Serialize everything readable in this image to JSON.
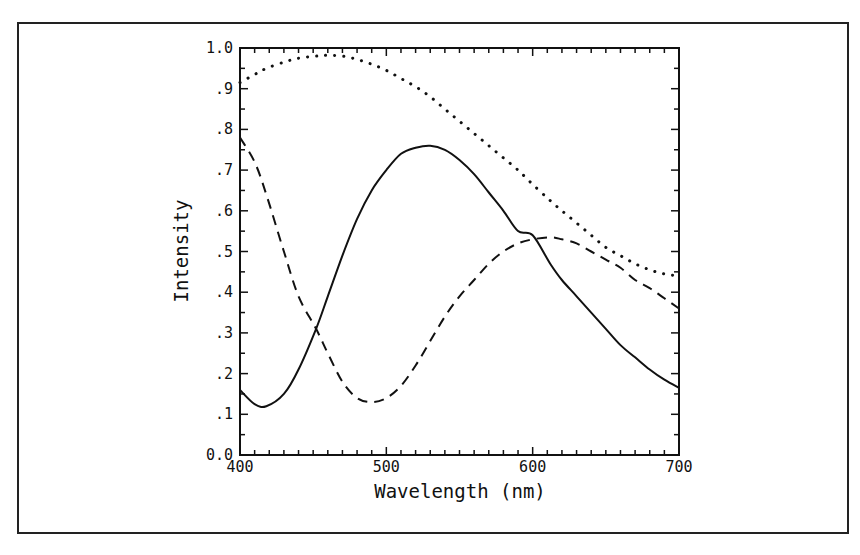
{
  "chart_data": {
    "type": "line",
    "title": "",
    "xlabel": "Wavelength (nm)",
    "ylabel": "Intensity",
    "xlim": [
      400,
      700
    ],
    "ylim": [
      0.0,
      1.0
    ],
    "grid": false,
    "legend": null,
    "x_ticks": [
      400,
      500,
      600,
      700
    ],
    "x_tick_labels": [
      "400",
      "500",
      "600",
      "700"
    ],
    "y_ticks": [
      0.0,
      0.1,
      0.2,
      0.3,
      0.4,
      0.5,
      0.6,
      0.7,
      0.8,
      0.9,
      1.0
    ],
    "y_tick_labels": [
      "0.0",
      ".1",
      ".2",
      ".3",
      ".4",
      ".5",
      ".6",
      ".7",
      ".8",
      ".9",
      "1.0"
    ],
    "x": [
      400,
      410,
      418,
      430,
      440,
      452,
      460,
      470,
      480,
      490,
      500,
      510,
      520,
      530,
      540,
      550,
      560,
      570,
      580,
      590,
      600,
      612,
      620,
      630,
      640,
      650,
      660,
      670,
      680,
      690,
      700
    ],
    "series": [
      {
        "name": "solid",
        "style": "solid",
        "values": [
          0.16,
          0.125,
          0.12,
          0.15,
          0.21,
          0.31,
          0.39,
          0.49,
          0.58,
          0.65,
          0.7,
          0.74,
          0.755,
          0.76,
          0.75,
          0.725,
          0.69,
          0.645,
          0.6,
          0.55,
          0.54,
          0.47,
          0.43,
          0.39,
          0.35,
          0.31,
          0.27,
          0.24,
          0.21,
          0.185,
          0.165
        ]
      },
      {
        "name": "dashed",
        "style": "dashed",
        "values": [
          0.78,
          0.72,
          0.64,
          0.5,
          0.39,
          0.31,
          0.25,
          0.18,
          0.14,
          0.13,
          0.14,
          0.17,
          0.22,
          0.28,
          0.34,
          0.39,
          0.43,
          0.47,
          0.5,
          0.52,
          0.53,
          0.535,
          0.53,
          0.52,
          0.5,
          0.48,
          0.46,
          0.43,
          0.41,
          0.385,
          0.36
        ]
      },
      {
        "name": "dotted",
        "style": "dotted",
        "values": [
          0.915,
          0.935,
          0.95,
          0.965,
          0.975,
          0.98,
          0.982,
          0.98,
          0.972,
          0.96,
          0.945,
          0.925,
          0.905,
          0.88,
          0.85,
          0.82,
          0.79,
          0.76,
          0.73,
          0.7,
          0.665,
          0.625,
          0.6,
          0.57,
          0.54,
          0.51,
          0.49,
          0.47,
          0.455,
          0.445,
          0.44
        ]
      }
    ]
  }
}
